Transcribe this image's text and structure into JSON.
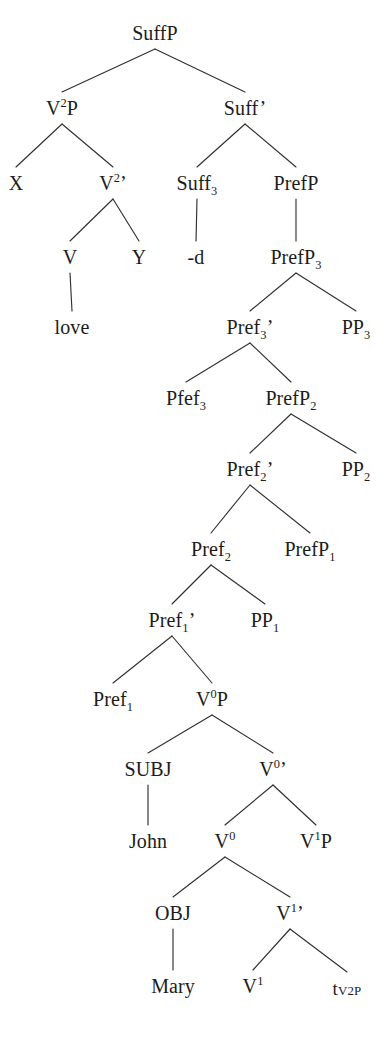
{
  "figure": {
    "kind": "syntactic-tree-diagram",
    "background_color": "#ffffff",
    "line_color": "#30302e",
    "text_color": "#1c1c1a",
    "width": 390,
    "height": 1043
  },
  "nodes": [
    {
      "id": "suffp",
      "text": "SuffP",
      "html": "SuffP",
      "x": 155,
      "y": 33
    },
    {
      "id": "v2p",
      "text": "V2P",
      "html": "V<sup>2</sup>P",
      "x": 62,
      "y": 108
    },
    {
      "id": "suffbar",
      "text": "Suff'",
      "html": "Suff<span class=\"prime\">’</span>",
      "x": 245,
      "y": 108
    },
    {
      "id": "x",
      "text": "X",
      "html": "X",
      "x": 16,
      "y": 183
    },
    {
      "id": "v2bar",
      "text": "V2'",
      "html": "V<sup>2</sup><span class=\"prime\">’</span>",
      "x": 113,
      "y": 183
    },
    {
      "id": "suff3",
      "text": "Suff3",
      "html": "Suff<sub>3</sub>",
      "x": 197,
      "y": 183
    },
    {
      "id": "prefp",
      "text": "PrefP",
      "html": "PrefP",
      "x": 296,
      "y": 183
    },
    {
      "id": "v",
      "text": "V",
      "html": "V",
      "x": 70,
      "y": 257
    },
    {
      "id": "y",
      "text": "Y",
      "html": "Y",
      "x": 139,
      "y": 257
    },
    {
      "id": "dsuffix",
      "text": "-d",
      "html": "-d",
      "x": 196,
      "y": 257
    },
    {
      "id": "prefp3",
      "text": "PrefP3",
      "html": "PrefP<sub>3</sub>",
      "x": 296,
      "y": 257
    },
    {
      "id": "love",
      "text": "love",
      "html": "love",
      "x": 72,
      "y": 327
    },
    {
      "id": "pref3bar",
      "text": "Pref3'",
      "html": "Pref<sub>3</sub><span class=\"prime\">’</span>",
      "x": 250,
      "y": 327
    },
    {
      "id": "pp3",
      "text": "PP3",
      "html": "PP<sub>3</sub>",
      "x": 356,
      "y": 327
    },
    {
      "id": "pfef3",
      "text": "Pfef3",
      "html": "Pfef<sub>3</sub>",
      "x": 186,
      "y": 398
    },
    {
      "id": "prefp2",
      "text": "PrefP2",
      "html": "PrefP<sub>2</sub>",
      "x": 291,
      "y": 398
    },
    {
      "id": "pref2bar",
      "text": "Pref2'",
      "html": "Pref<sub>2</sub><span class=\"prime\">’</span>",
      "x": 250,
      "y": 469
    },
    {
      "id": "pp2",
      "text": "PP2",
      "html": "PP<sub>2</sub>",
      "x": 356,
      "y": 469
    },
    {
      "id": "pref2",
      "text": "Pref2",
      "html": "Pref<sub>2</sub>",
      "x": 211,
      "y": 549
    },
    {
      "id": "prefp1",
      "text": "PrefP1",
      "html": "PrefP<sub>1</sub>",
      "x": 310,
      "y": 549
    },
    {
      "id": "pref1bar",
      "text": "Pref1'",
      "html": "Pref<sub>1</sub><span class=\"prime\">’</span>",
      "x": 172,
      "y": 620
    },
    {
      "id": "pp1",
      "text": "PP1",
      "html": "PP<sub>1</sub>",
      "x": 265,
      "y": 620
    },
    {
      "id": "pref1",
      "text": "Pref1",
      "html": "Pref<sub>1</sub>",
      "x": 113,
      "y": 699
    },
    {
      "id": "v0p",
      "text": "V0P",
      "html": "V<sup>0</sup>P",
      "x": 212,
      "y": 699
    },
    {
      "id": "subj",
      "text": "SUBJ",
      "html": "SUBJ",
      "x": 148,
      "y": 769
    },
    {
      "id": "v0bar",
      "text": "V0'",
      "html": "V<sup>0</sup><span class=\"prime\">’</span>",
      "x": 273,
      "y": 769
    },
    {
      "id": "john",
      "text": "John",
      "html": "John",
      "x": 148,
      "y": 841
    },
    {
      "id": "v0",
      "text": "V0",
      "html": "V<sup>0</sup>",
      "x": 225,
      "y": 841
    },
    {
      "id": "v1p",
      "text": "V1P",
      "html": "V<sup>1</sup>P",
      "x": 316,
      "y": 841
    },
    {
      "id": "obj",
      "text": "OBJ",
      "html": "OBJ",
      "x": 173,
      "y": 913
    },
    {
      "id": "v1bar",
      "text": "V1'",
      "html": "V<sup>1</sup><span class=\"prime\">’</span>",
      "x": 290,
      "y": 913
    },
    {
      "id": "mary",
      "text": "Mary",
      "html": "Mary",
      "x": 173,
      "y": 986
    },
    {
      "id": "v1",
      "text": "V1",
      "html": "V<sup>1</sup>",
      "x": 253,
      "y": 986
    },
    {
      "id": "trace",
      "text": "tV2P",
      "html": "t<span class=\"tsub\">V2P</span>",
      "x": 347,
      "y": 988,
      "variant": "trace"
    }
  ],
  "edges": [
    {
      "from": "suffp",
      "to": "v2p",
      "kind": "branch"
    },
    {
      "from": "suffp",
      "to": "suffbar",
      "kind": "branch"
    },
    {
      "from": "v2p",
      "to": "x",
      "kind": "branch"
    },
    {
      "from": "v2p",
      "to": "v2bar",
      "kind": "branch"
    },
    {
      "from": "suffbar",
      "to": "suff3",
      "kind": "branch"
    },
    {
      "from": "suffbar",
      "to": "prefp",
      "kind": "branch"
    },
    {
      "from": "v2bar",
      "to": "v",
      "kind": "branch"
    },
    {
      "from": "v2bar",
      "to": "y",
      "kind": "branch"
    },
    {
      "from": "suff3",
      "to": "dsuffix",
      "kind": "stem"
    },
    {
      "from": "prefp",
      "to": "prefp3",
      "kind": "stem"
    },
    {
      "from": "v",
      "to": "love",
      "kind": "stem"
    },
    {
      "from": "prefp3",
      "to": "pref3bar",
      "kind": "branch"
    },
    {
      "from": "prefp3",
      "to": "pp3",
      "kind": "branch"
    },
    {
      "from": "pref3bar",
      "to": "pfef3",
      "kind": "branch"
    },
    {
      "from": "pref3bar",
      "to": "prefp2",
      "kind": "branch"
    },
    {
      "from": "prefp2",
      "to": "pref2bar",
      "kind": "branch"
    },
    {
      "from": "prefp2",
      "to": "pp2",
      "kind": "branch"
    },
    {
      "from": "pref2bar",
      "to": "pref2",
      "kind": "branch"
    },
    {
      "from": "pref2bar",
      "to": "prefp1",
      "kind": "branch"
    },
    {
      "from": "pref2",
      "to": "pref1bar",
      "kind": "branch"
    },
    {
      "from": "pref2",
      "to": "pp1",
      "kind": "branch"
    },
    {
      "from": "pref1bar",
      "to": "pref1",
      "kind": "branch"
    },
    {
      "from": "pref1bar",
      "to": "v0p",
      "kind": "branch"
    },
    {
      "from": "v0p",
      "to": "subj",
      "kind": "branch"
    },
    {
      "from": "v0p",
      "to": "v0bar",
      "kind": "branch"
    },
    {
      "from": "subj",
      "to": "john",
      "kind": "stem"
    },
    {
      "from": "v0bar",
      "to": "v0",
      "kind": "branch"
    },
    {
      "from": "v0bar",
      "to": "v1p",
      "kind": "branch"
    },
    {
      "from": "v0",
      "to": "obj",
      "kind": "branch"
    },
    {
      "from": "v0",
      "to": "v1bar",
      "kind": "branch"
    },
    {
      "from": "obj",
      "to": "mary",
      "kind": "stem"
    },
    {
      "from": "v1bar",
      "to": "v1",
      "kind": "branch"
    },
    {
      "from": "v1bar",
      "to": "trace",
      "kind": "branch"
    }
  ]
}
